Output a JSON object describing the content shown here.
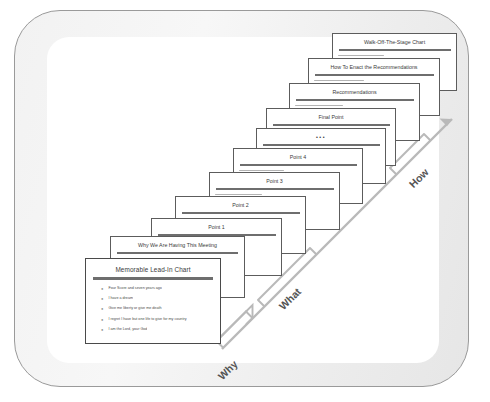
{
  "diagram": {
    "type": "presentation-storyboard",
    "frame": {
      "border_color": "#9a9a9a",
      "fill_color": "#f0f0f0",
      "inner_fill": "#ffffff"
    },
    "axis": {
      "color": "#b0b0b0",
      "direction": "diagonal-up-right",
      "groups": [
        {
          "label": "Why",
          "name": "axis-group-why"
        },
        {
          "label": "What",
          "name": "axis-group-what"
        },
        {
          "label": "How",
          "name": "axis-group-how"
        }
      ]
    },
    "slides": [
      {
        "title": "Memorable Lead-In Chart",
        "bullets": [
          "Four Score and seven years ago",
          "I have a dream",
          "Give me liberty or give me death",
          "I regret I have but one life to give for my country",
          "I am the Lord, your God"
        ]
      },
      {
        "title": "Why We Are Having This Meeting",
        "bullets": []
      },
      {
        "title": "Point 1",
        "bullets": []
      },
      {
        "title": "Point 2",
        "bullets": []
      },
      {
        "title": "Point 3",
        "bullets": []
      },
      {
        "title": "Point 4",
        "bullets": []
      },
      {
        "title": "•••",
        "bullets": []
      },
      {
        "title": "Final Point",
        "bullets": []
      },
      {
        "title": "Recommendations",
        "bullets": []
      },
      {
        "title": "How To Enact the Recommendations",
        "bullets": []
      },
      {
        "title": "Walk-Off-The-Stage Chart",
        "bullets": []
      }
    ]
  }
}
